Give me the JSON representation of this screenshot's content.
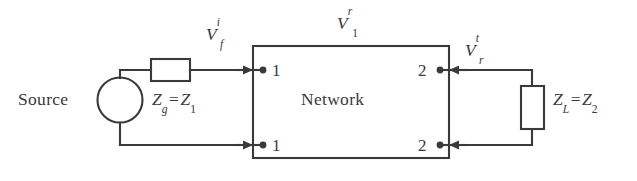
{
  "figure": {
    "type": "circuit-diagram",
    "stroke_color": "#3a3a3a",
    "background_color": "#ffffff",
    "width": 637,
    "height": 181
  },
  "labels": {
    "source": "Source",
    "network": "Network",
    "generator_impedance": {
      "base": "Z",
      "sub": "g",
      "equals": "=",
      "rhs_base": "Z",
      "rhs_sub": "1"
    },
    "load_impedance": {
      "base": "Z",
      "sub": "L",
      "equals": "=",
      "rhs_base": "Z",
      "rhs_sub": "2"
    },
    "incident_voltage": {
      "base": "V",
      "sub": "f",
      "sup": "i"
    },
    "reflected_voltage": {
      "base": "V",
      "sub": "1",
      "sup": "r"
    },
    "transmitted_voltage": {
      "base": "V",
      "sub": "r",
      "sup": "t"
    }
  },
  "ports": {
    "left_top": "1",
    "left_bottom": "1",
    "right_top": "2",
    "right_bottom": "2"
  },
  "components": {
    "source_symbol": "circle-source",
    "series_resistor": "rectangle-resistor-horizontal",
    "load_resistor": "rectangle-resistor-vertical",
    "network_block": "rectangle-two-port"
  }
}
